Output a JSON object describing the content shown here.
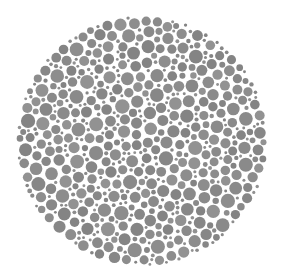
{
  "image": {
    "kind": "ishihara-color-vision-test-plate",
    "title": "Ishihara Color Vision Test Plate (grayscale)",
    "width": 281,
    "height": 280,
    "background_color": "#ffffff",
    "hidden_figure_visible": false,
    "hidden_figure_text": ""
  },
  "plate": {
    "name": "dot-mosaic-disc",
    "center_x": 142,
    "center_y": 141,
    "radius": 126,
    "dot_color": "#8a8a8a",
    "dot_color_variants": [
      "#878787",
      "#8a8a8a",
      "#8d8d8d",
      "#929292",
      "#848484"
    ],
    "gap_color": "#ffffff",
    "dot_count": 1180,
    "dot_radius_min": 1.4,
    "dot_radius_max": 7.2,
    "dot_gap": 0.85,
    "packing": "random-dart-throwing",
    "seed": 20250411
  },
  "chart_data": {
    "type": "scatter",
    "xlabel": "",
    "ylabel": "",
    "xlim": [
      0,
      281
    ],
    "ylim": [
      0,
      280
    ],
    "grid": false,
    "legend": "none",
    "series": [
      {
        "name": "plate-dots",
        "marker": "circle",
        "color": "#8a8a8a",
        "size_range_px": [
          2.8,
          14.4
        ],
        "count": 1180,
        "bounding_disc": {
          "cx": 142,
          "cy": 141,
          "r": 126
        }
      }
    ],
    "annotations": []
  }
}
